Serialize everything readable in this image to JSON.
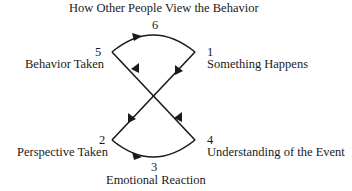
{
  "title": "How Other People View the Behavior",
  "nodes": [
    {
      "number": "1",
      "label": "Something Happens"
    },
    {
      "number": "2",
      "label": "Perspective Taken"
    },
    {
      "number": "3",
      "label": "Emotional Reaction"
    },
    {
      "number": "4",
      "label": "Understanding of the Event"
    },
    {
      "number": "5",
      "label": "Behavior Taken"
    },
    {
      "number": "6",
      "label": ""
    }
  ],
  "colors": {
    "line": "#1a1a1a",
    "text": "#1a1a1a",
    "background": "#ffffff"
  }
}
